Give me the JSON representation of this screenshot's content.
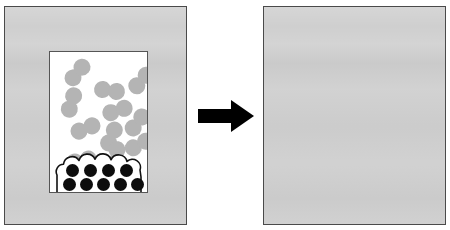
{
  "figure": {
    "background_color": "#ffffff",
    "width": 450,
    "height": 230
  },
  "colors": {
    "panel_fill": "#cfcfcf",
    "panel_border": "#4a4a4a",
    "vessel_fill": "#ffffff",
    "vessel_border": "#555555",
    "gray_atom": "#b4b4b4",
    "black_atom": "#0d0d0d",
    "arrow": "#000000"
  },
  "arrow": {
    "icon": "right-arrow-icon",
    "direction": "right",
    "label": "reacts to form"
  },
  "panels": [
    {
      "id": "before",
      "name": "reactants-panel",
      "label": "Before reaction",
      "vessel": {
        "label": "reaction vessel",
        "gas_phase": {
          "label": "diatomic gas molecules",
          "species": "gray diatomic molecule",
          "count": 11,
          "molecules": [
            {
              "x": 12,
              "y": 12,
              "rotation": -50
            },
            {
              "x": 44,
              "y": 30,
              "rotation": 8
            },
            {
              "x": 76,
              "y": 20,
              "rotation": -48
            },
            {
              "x": 6,
              "y": 42,
              "rotation": -72
            },
            {
              "x": 52,
              "y": 50,
              "rotation": -18
            },
            {
              "x": 20,
              "y": 68,
              "rotation": -22
            },
            {
              "x": 72,
              "y": 62,
              "rotation": -52
            },
            {
              "x": 46,
              "y": 76,
              "rotation": -66
            },
            {
              "x": 74,
              "y": 84,
              "rotation": -28
            },
            {
              "x": 16,
              "y": 100,
              "rotation": -12
            },
            {
              "x": 50,
              "y": 96,
              "rotation": -78
            }
          ]
        },
        "condensed_phase": {
          "label": "condensed solid deposit",
          "species": "black atom",
          "outline": "bumpy blob outline",
          "count": 9,
          "rows": [
            {
              "label": "top row",
              "count": 4
            },
            {
              "label": "bottom row",
              "count": 5
            }
          ]
        }
      }
    },
    {
      "id": "after",
      "name": "products-panel",
      "label": "After reaction",
      "vessel": {
        "label": "reaction vessel",
        "solid_phase": {
          "label": "packed binary solid lattice",
          "packing": "hexagonal close packed, alternating offset rows",
          "gray_count": 22,
          "black_count": 9,
          "total_count": 31,
          "rows": [
            {
              "index": 1,
              "offset": false,
              "colors": [
                "black",
                "gray",
                "gray",
                "black",
                "gray"
              ]
            },
            {
              "index": 2,
              "offset": true,
              "colors": [
                "gray",
                "black",
                "gray",
                "gray"
              ]
            },
            {
              "index": 3,
              "offset": false,
              "colors": [
                "black",
                "gray",
                "gray",
                "black",
                "gray"
              ]
            },
            {
              "index": 4,
              "offset": true,
              "colors": [
                "gray",
                "black",
                "gray",
                "gray"
              ]
            },
            {
              "index": 5,
              "offset": false,
              "colors": [
                "black",
                "gray",
                "gray",
                "black",
                "gray"
              ]
            },
            {
              "index": 6,
              "offset": true,
              "colors": [
                "gray",
                "black",
                "gray",
                "gray"
              ]
            }
          ]
        }
      }
    }
  ]
}
